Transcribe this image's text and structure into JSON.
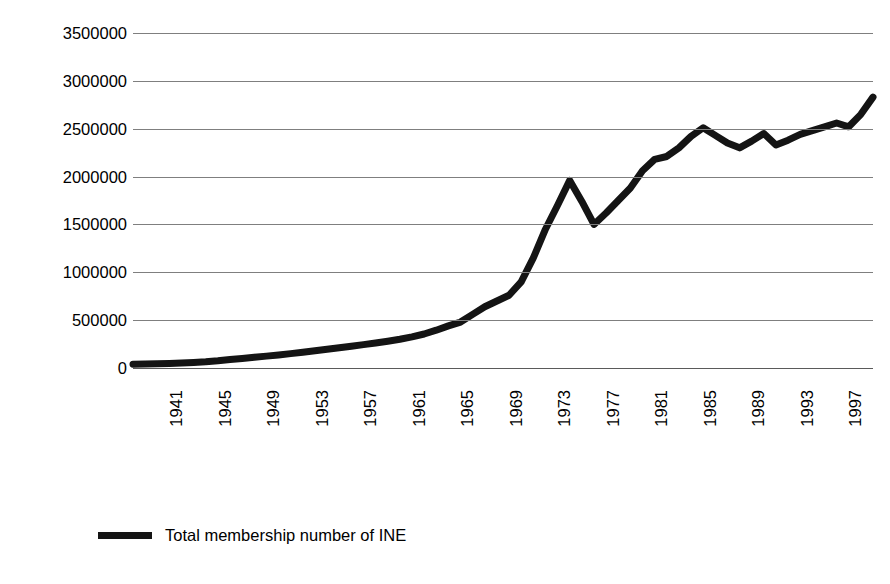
{
  "chart_data": {
    "type": "line",
    "title": "",
    "subtitle": "",
    "xlabel": "",
    "ylabel": "",
    "grid": true,
    "legend_position": "bottom-left",
    "xlim": [
      1941,
      2002
    ],
    "ylim": [
      0,
      3500000
    ],
    "y_ticks": [
      3500000,
      3000000,
      2500000,
      2000000,
      1500000,
      1000000,
      500000,
      0
    ],
    "y_tick_labels": [
      "3500000",
      "3000000",
      "2500000",
      "2000000",
      "1500000",
      "1000000",
      "500000",
      "0"
    ],
    "x_tick_labels": [
      "1941",
      "1945",
      "1949",
      "1953",
      "1957",
      "1961",
      "1965",
      "1969",
      "1973",
      "1977",
      "1981",
      "1985",
      "1989",
      "1993",
      "1997",
      "2001"
    ],
    "x_tick_values": [
      1941,
      1945,
      1949,
      1953,
      1957,
      1961,
      1965,
      1969,
      1973,
      1977,
      1981,
      1985,
      1989,
      1993,
      1997,
      2001
    ],
    "series": [
      {
        "name": "Total membership number of INE",
        "color": "#141414",
        "x": [
          1941,
          1942,
          1943,
          1944,
          1945,
          1946,
          1947,
          1948,
          1949,
          1950,
          1951,
          1952,
          1953,
          1954,
          1955,
          1956,
          1957,
          1958,
          1959,
          1960,
          1961,
          1962,
          1963,
          1964,
          1965,
          1966,
          1967,
          1968,
          1969,
          1970,
          1971,
          1972,
          1973,
          1974,
          1975,
          1976,
          1977,
          1978,
          1979,
          1980,
          1981,
          1982,
          1983,
          1984,
          1985,
          1986,
          1987,
          1988,
          1989,
          1990,
          1991,
          1992,
          1993,
          1994,
          1995,
          1996,
          1997,
          1998,
          1999,
          2000,
          2001,
          2002
        ],
        "values": [
          40000,
          42000,
          45000,
          48000,
          52000,
          58000,
          65000,
          75000,
          88000,
          100000,
          112000,
          124000,
          136000,
          150000,
          165000,
          180000,
          196000,
          212000,
          228000,
          244000,
          262000,
          280000,
          300000,
          325000,
          355000,
          395000,
          440000,
          480000,
          560000,
          640000,
          700000,
          760000,
          900000,
          1150000,
          1450000,
          1700000,
          1960000,
          1740000,
          1500000,
          1620000,
          1750000,
          1880000,
          2060000,
          2180000,
          2210000,
          2300000,
          2420000,
          2510000,
          2430000,
          2350000,
          2300000,
          2370000,
          2450000,
          2330000,
          2380000,
          2440000,
          2480000,
          2520000,
          2560000,
          2520000,
          2650000,
          2830000
        ]
      }
    ]
  },
  "legend": {
    "entries": [
      {
        "label": "Total membership number of INE",
        "color": "#141414",
        "marker": "line-swatch"
      }
    ]
  },
  "colors": {
    "series_line": "#141414",
    "gridline": "#7f7f7f",
    "background": "#ffffff",
    "text": "#000000"
  }
}
